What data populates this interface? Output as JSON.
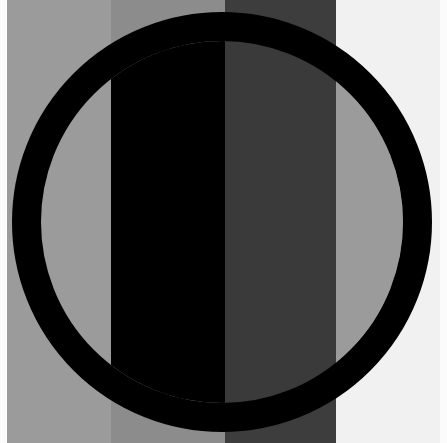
{
  "figure": {
    "bands": [
      {
        "x": 7,
        "width": 104,
        "color": "#9b9b9b"
      },
      {
        "x": 111,
        "width": 114,
        "color": "#8c8c8c"
      },
      {
        "x": 225,
        "width": 111,
        "color": "#3d3d3d"
      },
      {
        "x": 336,
        "width": 104,
        "color": "#f1f1f1"
      }
    ],
    "ring": {
      "cx": 222,
      "cy": 222,
      "outer_r": 210,
      "inner_r": 181,
      "color": "#000000"
    },
    "inner_fills": [
      {
        "x": 111,
        "width": 114,
        "color": "#000000"
      },
      {
        "x": 225,
        "width": 111,
        "color": "#3a3a3a"
      },
      {
        "x": 336,
        "width": 80,
        "color": "#9b9b9b"
      }
    ]
  }
}
